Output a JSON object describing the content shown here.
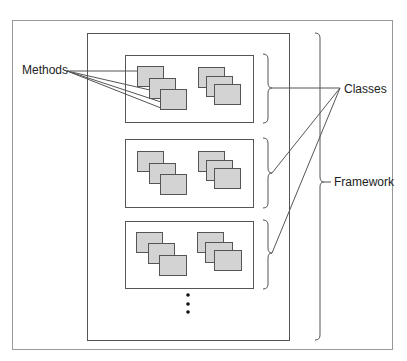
{
  "diagram": {
    "labels": {
      "methods": "Methods",
      "classes": "Classes",
      "framework": "Framework"
    },
    "structure": {
      "framework_contains": "classes",
      "class_count_shown": 3,
      "classes_continue": true,
      "methods_per_class": 6,
      "method_stacks_per_class": 2,
      "methods_per_stack": 3
    },
    "colors": {
      "line": "#555555",
      "method_fill": "#d3d3d3",
      "background": "#ffffff",
      "outer_border": "#999999"
    }
  }
}
